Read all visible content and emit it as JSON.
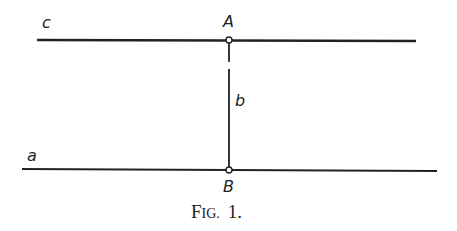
{
  "diagram": {
    "labels": {
      "line_c": "c",
      "line_a": "a",
      "line_b": "b",
      "point_A": "A",
      "point_B": "B"
    },
    "caption": {
      "prefix_big": "F",
      "prefix_small": "IG.",
      "number": "1."
    },
    "colors": {
      "stroke": "#222222",
      "background": "#ffffff"
    }
  }
}
